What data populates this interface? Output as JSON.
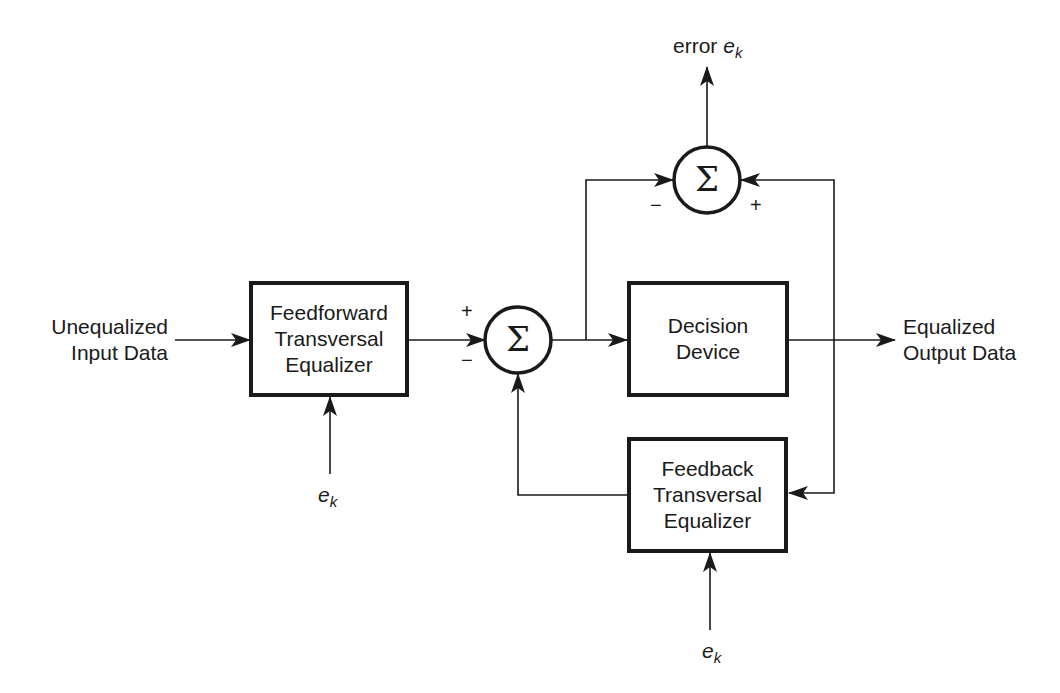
{
  "diagram": {
    "type": "block-diagram",
    "input_label": {
      "line1": "Unequalized",
      "line2": "Input Data"
    },
    "output_label": {
      "line1": "Equalized",
      "line2": "Output Data"
    },
    "blocks": [
      {
        "id": "feedforward",
        "line1": "Feedforward",
        "line2": "Transversal",
        "line3": "Equalizer"
      },
      {
        "id": "decision",
        "line1": "Decision",
        "line2": "Device"
      },
      {
        "id": "feedback",
        "line1": "Feedback",
        "line2": "Transversal",
        "line3": "Equalizer"
      }
    ],
    "summers": [
      {
        "id": "main-summer",
        "symbol": "Σ",
        "signs": {
          "top_left": "+",
          "bottom_left": "−"
        }
      },
      {
        "id": "error-summer",
        "symbol": "Σ",
        "signs": {
          "left": "−",
          "right": "+"
        }
      }
    ],
    "error_output": {
      "prefix": "error",
      "var": "e",
      "sub": "k"
    },
    "ek_labels": [
      {
        "id": "ff-adapt",
        "var": "e",
        "sub": "k"
      },
      {
        "id": "fb-adapt",
        "var": "e",
        "sub": "k"
      }
    ],
    "colors": {
      "line": "#1a1a1a",
      "background": "#ffffff"
    }
  }
}
